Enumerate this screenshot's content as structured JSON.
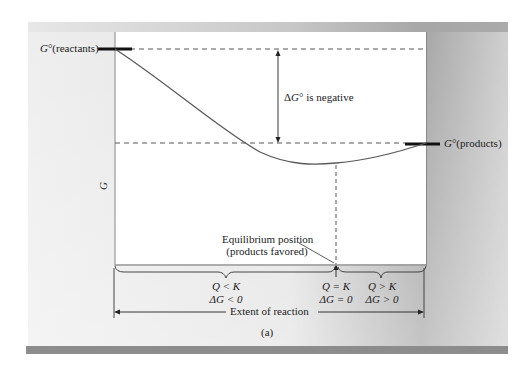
{
  "figure": {
    "panel_label": "(a)",
    "colors": {
      "page_bg": "#ffffff",
      "panel_bg_light": "#ececec",
      "panel_bg_dark": "#9a9a9a",
      "plot_bg": "#ffffff",
      "bottom_bar": "#8c8c8c",
      "curve": "#555555",
      "level_bar": "#111111",
      "dashed": "#444444"
    }
  },
  "axes": {
    "y_label": "G",
    "x_label": "Extent of reaction"
  },
  "levels": {
    "reactants_label": "G°(reactants)",
    "products_label": "G°(products)"
  },
  "delta_g_annotation": "ΔG° is negative",
  "equilibrium": {
    "line1": "Equilibrium position",
    "line2": "(products favored)"
  },
  "regions": [
    {
      "name": "left",
      "q": "Q < K",
      "dg": "ΔG < 0"
    },
    {
      "name": "equilibrium",
      "q": "Q = K",
      "dg": "ΔG = 0"
    },
    {
      "name": "right",
      "q": "Q > K",
      "dg": "ΔG > 0"
    }
  ],
  "chart_data": {
    "type": "line",
    "title": "",
    "xlabel": "Extent of reaction",
    "ylabel": "G",
    "points_normalized": [
      {
        "x": 0.0,
        "y": 1.0,
        "label": "G°(reactants)"
      },
      {
        "x": 0.2,
        "y": 0.72
      },
      {
        "x": 0.4,
        "y": 0.42
      },
      {
        "x": 0.6,
        "y": 0.2
      },
      {
        "x": 0.71,
        "y": 0.0,
        "label": "Equilibrium (minimum)"
      },
      {
        "x": 0.85,
        "y": 0.08
      },
      {
        "x": 1.0,
        "y": 0.17,
        "label": "G°(products)"
      }
    ],
    "annotations": [
      "ΔG° is negative",
      "Equilibrium position (products favored)",
      "Q < K, ΔG < 0",
      "Q = K, ΔG = 0",
      "Q > K, ΔG > 0"
    ],
    "grid": false
  }
}
